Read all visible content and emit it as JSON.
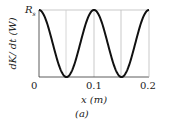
{
  "chart_data": {
    "type": "line",
    "title": "",
    "xlabel": "x (m)",
    "ylabel": "dK/dt (W)",
    "caption": "(a)",
    "x_ticks": [
      "0",
      "0.1",
      "0.2"
    ],
    "y_ticks": [
      "R_s"
    ],
    "xlim": [
      0,
      0.2
    ],
    "ylim": [
      0,
      "R_s"
    ],
    "grid": true,
    "series": [
      {
        "name": "dK/dt",
        "x": [
          0,
          0.025,
          0.05,
          0.075,
          0.1,
          0.125,
          0.15,
          0.175,
          0.2
        ],
        "y_relative_to_Rs": [
          1,
          0.5,
          0,
          0.5,
          1,
          0.5,
          0,
          0.5,
          1
        ]
      }
    ]
  },
  "labels": {
    "y_tick_top": "R",
    "y_tick_top_sub": "s",
    "x_tick_0": "0",
    "x_tick_1": "0.1",
    "x_tick_2": "0.2",
    "xlabel": "x (m)",
    "ylabel": "dK/ dt (W)",
    "caption": "(a)"
  }
}
